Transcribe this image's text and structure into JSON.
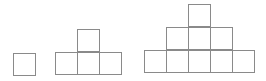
{
  "diagram": {
    "title": "",
    "line_color": "#8a8a8a",
    "background": "#ffffff",
    "square_size": 22,
    "figures": [
      {
        "stage": 1,
        "square_count": 1,
        "squares": [
          {
            "x": 13,
            "y": 53
          }
        ]
      },
      {
        "stage": 2,
        "square_count": 4,
        "squares": [
          {
            "x": 77,
            "y": 29
          },
          {
            "x": 55,
            "y": 52
          },
          {
            "x": 77,
            "y": 52
          },
          {
            "x": 99,
            "y": 52
          }
        ]
      },
      {
        "stage": 3,
        "square_count": 9,
        "squares": [
          {
            "x": 188,
            "y": 4
          },
          {
            "x": 166,
            "y": 27
          },
          {
            "x": 188,
            "y": 27
          },
          {
            "x": 210,
            "y": 27
          },
          {
            "x": 144,
            "y": 50
          },
          {
            "x": 166,
            "y": 50
          },
          {
            "x": 188,
            "y": 50
          },
          {
            "x": 210,
            "y": 50
          },
          {
            "x": 232,
            "y": 50
          }
        ]
      }
    ]
  }
}
